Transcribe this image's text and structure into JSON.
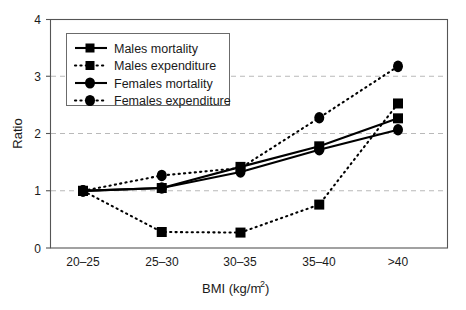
{
  "chart_data": {
    "type": "line",
    "title": "",
    "xlabel": "BMI (kg/m2)",
    "xlabel_base": "BMI (kg/m",
    "xlabel_exponent": "2",
    "xlabel_close": ")",
    "ylabel": "Ratio",
    "categories": [
      "20–25",
      "25–30",
      "30–35",
      "35–40",
      ">40"
    ],
    "ylim": [
      0,
      4
    ],
    "yticks": [
      "0",
      "1",
      "2",
      "3",
      "4"
    ],
    "ytick_values": [
      0,
      1,
      2,
      3,
      4
    ],
    "grid": "horizontal dashed gridlines at 1, 2, 3",
    "gridline_values": [
      1,
      2,
      3
    ],
    "legend_position": "upper left inside axes",
    "series": [
      {
        "name": "Males mortality",
        "values": [
          1.0,
          1.05,
          1.42,
          1.78,
          2.27
        ],
        "style": "solid",
        "marker": "square",
        "color": "#000000"
      },
      {
        "name": "Males expenditure",
        "values": [
          1.0,
          0.28,
          0.27,
          0.76,
          2.53
        ],
        "style": "dotted",
        "marker": "square",
        "color": "#000000"
      },
      {
        "name": "Females mortality",
        "values": [
          1.0,
          1.05,
          1.33,
          1.72,
          2.07
        ],
        "style": "solid",
        "marker": "circle",
        "color": "#000000"
      },
      {
        "name": "Females expenditure",
        "values": [
          1.0,
          1.27,
          1.4,
          2.28,
          3.18
        ],
        "style": "dotted",
        "marker": "circle",
        "color": "#000000"
      }
    ]
  },
  "legend": {
    "items": [
      {
        "label": "Males mortality"
      },
      {
        "label": "Males expenditure"
      },
      {
        "label": "Females mortality"
      },
      {
        "label": "Females expenditure"
      }
    ]
  },
  "axes": {
    "y_title": "Ratio",
    "x_title_base": "BMI (kg/m",
    "x_title_exponent": "2",
    "x_title_close": ")",
    "y_ticks": [
      "4",
      "3",
      "2",
      "1",
      "0"
    ],
    "x_ticks": [
      "20–25",
      "25–30",
      "30–35",
      "35–40",
      ">40"
    ]
  },
  "colors": {
    "series": "#000000",
    "frame": "#555555",
    "grid": "#b9b9b9",
    "background": "#ffffff"
  }
}
